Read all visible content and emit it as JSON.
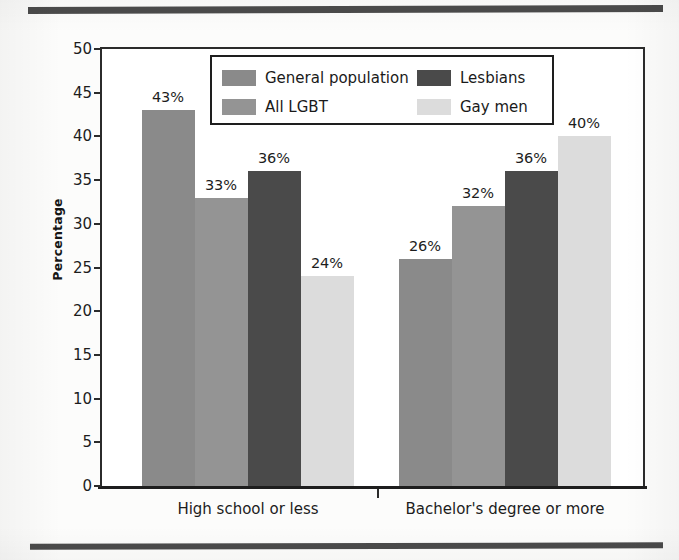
{
  "chart_data": {
    "type": "bar",
    "title": "",
    "subtitle": "",
    "xlabel": "",
    "ylabel": "Percentage",
    "categories": [
      "High school or less",
      "Bachelor's degree or more"
    ],
    "series": [
      {
        "name": "General population",
        "color": "#8a8a8a",
        "values": [
          43,
          26
        ],
        "labels": [
          "43%",
          "26%"
        ]
      },
      {
        "name": "All LGBT",
        "color": "#949494",
        "values": [
          33,
          32
        ],
        "labels": [
          "33%",
          "32%"
        ]
      },
      {
        "name": "Lesbians",
        "color": "#4a4a4a",
        "values": [
          36,
          36
        ],
        "labels": [
          "36%",
          "36%"
        ]
      },
      {
        "name": "Gay men",
        "color": "#dcdcdc",
        "values": [
          24,
          40
        ],
        "labels": [
          "24%",
          "40%"
        ]
      }
    ],
    "ylim": [
      0,
      50
    ],
    "ytick_step": 5,
    "yticks": [
      "50",
      "45",
      "40",
      "35",
      "30",
      "25",
      "20",
      "15",
      "10",
      "5",
      "0"
    ],
    "grid": false,
    "legend_position": "top-center-inside",
    "legend_layout": "2x2"
  },
  "legend": {
    "items": [
      {
        "label": "General population",
        "color": "#8a8a8a"
      },
      {
        "label": "All LGBT",
        "color": "#949494"
      },
      {
        "label": "Lesbians",
        "color": "#4a4a4a"
      },
      {
        "label": "Gay men",
        "color": "#dcdcdc"
      }
    ]
  },
  "axes": {
    "y_label": "Percentage",
    "y_ticks": [
      "50",
      "45",
      "40",
      "35",
      "30",
      "25",
      "20",
      "15",
      "10",
      "5",
      "0"
    ],
    "x_labels": [
      "High school or less",
      "Bachelor's degree or more"
    ]
  }
}
